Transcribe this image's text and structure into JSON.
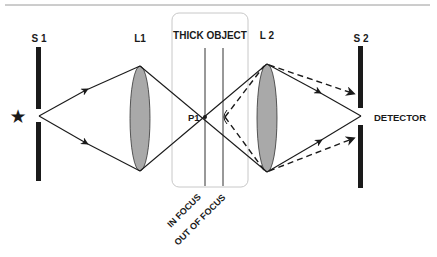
{
  "diagram": {
    "labels": {
      "s1": "S 1",
      "l1": "L1",
      "object": "THICK OBJECT",
      "l2": "L 2",
      "s2": "S 2",
      "p1": "P1",
      "detector": "DETECTOR",
      "in_focus": "IN  FOCUS",
      "out_of_focus": "OUT OF FOCUS"
    },
    "icons": {
      "source": "★"
    },
    "colors": {
      "line": "#1a1a1a",
      "lens_fill": "#a9a9a9",
      "box_border": "#c8c8c8",
      "top_rule": "#9a9a9a"
    },
    "legend": {
      "solid_ray": "in-focus light path",
      "dashed_ray": "out-of-focus light path"
    }
  }
}
